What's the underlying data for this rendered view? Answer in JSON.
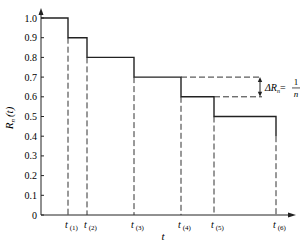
{
  "chart_data": {
    "type": "line",
    "subtype": "step",
    "title": "",
    "xlabel": "t",
    "ylabel": "R_n(t)",
    "ylim": [
      0,
      1.0
    ],
    "y_ticks": [
      "0",
      "0.1",
      "0.2",
      "0.3",
      "0.4",
      "0.5",
      "0.6",
      "0.7",
      "0.8",
      "0.9",
      "1.0"
    ],
    "x_ticks": [
      "t(1)",
      "t(2)",
      "t(3)",
      "t(4)",
      "t(5)",
      "t(6)"
    ],
    "series": [
      {
        "name": "R_n(t)",
        "x": [
          "0",
          "t(1)",
          "t(2)",
          "t(3)",
          "t(4)",
          "t(5)",
          "t(6)"
        ],
        "values": [
          1.0,
          0.9,
          0.8,
          0.7,
          0.6,
          0.5,
          0.4
        ]
      }
    ],
    "annotations": [
      {
        "text": "ΔR_n = 1/n",
        "between": [
          0.7,
          0.6
        ],
        "at": "right of t(4)"
      }
    ],
    "grid": false
  },
  "labels": {
    "ylabel_main": "R",
    "ylabel_sub": "n",
    "ylabel_arg": "(t)",
    "xlabel": "t",
    "delta_main": "ΔR",
    "delta_sub": "n",
    "delta_eq": "=",
    "frac_num": "1",
    "frac_den": "n"
  }
}
